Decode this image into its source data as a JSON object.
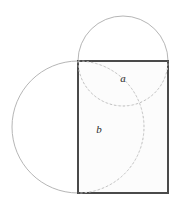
{
  "figure": {
    "canvas": {
      "width": 177,
      "height": 213,
      "background": "#ffffff"
    },
    "colors": {
      "rectangle_stroke": "#4a4a4a",
      "rectangle_fill": "#fcfcfc",
      "circle_stroke": "#b6b6b6",
      "arc_stroke": "#c2c2c2",
      "label_color": "#2b2b2b"
    },
    "rectangle": {
      "name": "main-rectangle",
      "x": 78,
      "y": 61,
      "width": 90,
      "height": 132,
      "stroke_width": 2
    },
    "small_circle": {
      "name": "top-circle",
      "cx": 123,
      "cy": 61,
      "r": 45,
      "diameter": 90,
      "stroke_width": 1
    },
    "large_circle": {
      "name": "left-circle",
      "cx": 78,
      "cy": 127,
      "r": 66,
      "diameter": 132,
      "stroke_width": 1
    },
    "arcs": [
      {
        "name": "arc-a",
        "label": "a",
        "label_x": 123,
        "label_y": 79,
        "description": "lower semicircular arc of the top circle, spanning the rectangle top corners",
        "path": "M 78 61 A 45 45 0 0 0 168 61",
        "dashed": true
      },
      {
        "name": "arc-b",
        "label": "b",
        "label_x": 99,
        "label_y": 130,
        "description": "right semicircular arc of the left circle, spanning the rectangle left corners",
        "path": "M 78 61 A 66 66 0 0 1 78 193",
        "dashed": true
      }
    ],
    "labels": [
      {
        "id": "a",
        "text": "a"
      },
      {
        "id": "b",
        "text": "b"
      }
    ]
  }
}
